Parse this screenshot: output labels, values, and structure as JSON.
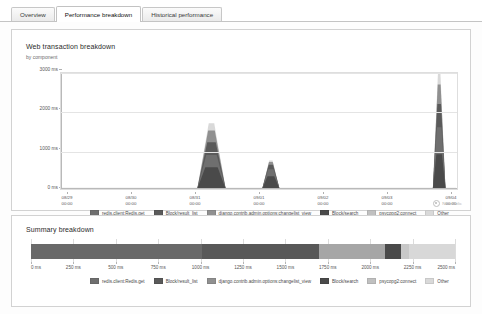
{
  "tabs": [
    {
      "label": "Overview",
      "active": false
    },
    {
      "label": "Performance breakdown",
      "active": true
    },
    {
      "label": "Historical performance",
      "active": false
    }
  ],
  "breakdown_panel": {
    "title": "Web transaction breakdown",
    "subtitle": "by component",
    "watermark": "New Relic"
  },
  "summary_panel": {
    "title": "Summary breakdown"
  },
  "legend": [
    {
      "label": "redis.client:Redis.get",
      "color": "#6f6f6f"
    },
    {
      "label": "Block/result_list",
      "color": "#5a5a5a"
    },
    {
      "label": "django.contrib.admin.options:changelist_view",
      "color": "#909090"
    },
    {
      "label": "Block/search",
      "color": "#4a4a4a"
    },
    {
      "label": "psycopg2:connect",
      "color": "#c0c0c0"
    },
    {
      "label": "Other",
      "color": "#d9d9d9"
    }
  ],
  "chart_data": [
    {
      "type": "area",
      "title": "Web transaction breakdown",
      "subtitle": "by component",
      "xlabel": "",
      "ylabel": "",
      "ylim": [
        0,
        3000
      ],
      "yticks": [
        0,
        1000,
        2000,
        3000
      ],
      "ytick_labels": [
        "0 ms",
        "1000 ms",
        "2000 ms",
        "3000 ms"
      ],
      "grid": true,
      "legend_position": "bottom",
      "x_tick_labels": [
        {
          "date": "08/29",
          "time": "00:00"
        },
        {
          "date": "08/30",
          "time": "00:00"
        },
        {
          "date": "08/31",
          "time": "00:00"
        },
        {
          "date": "09/01",
          "time": "00:00"
        },
        {
          "date": "09/02",
          "time": "00:00"
        },
        {
          "date": "09/03",
          "time": "00:00"
        },
        {
          "date": "09/04",
          "time": "00:00"
        }
      ],
      "series": [
        {
          "name": "redis.client:Redis.get",
          "color": "#6f6f6f"
        },
        {
          "name": "Block/result_list",
          "color": "#5a5a5a"
        },
        {
          "name": "django.contrib.admin.options:changelist_view",
          "color": "#909090"
        },
        {
          "name": "Block/search",
          "color": "#4a4a4a"
        },
        {
          "name": "psycopg2:connect",
          "color": "#c0c0c0"
        },
        {
          "name": "Other",
          "color": "#d9d9d9"
        }
      ],
      "peaks": [
        {
          "center_pct": 38.0,
          "half_width_pct": 3.6,
          "height_ms": 1700,
          "stack": [
            {
              "series": "Block/search",
              "ms": 560,
              "color": "#4a4a4a"
            },
            {
              "series": "redis.client:Redis.get",
              "ms": 320,
              "color": "#6f6f6f"
            },
            {
              "series": "Block/result_list",
              "ms": 330,
              "color": "#5a5a5a"
            },
            {
              "series": "django.contrib.admin.options:changelist_view",
              "ms": 300,
              "color": "#909090"
            },
            {
              "series": "Other",
              "ms": 190,
              "color": "#d9d9d9"
            }
          ]
        },
        {
          "center_pct": 53.0,
          "half_width_pct": 2.2,
          "height_ms": 740,
          "stack": [
            {
              "series": "Block/search",
              "ms": 330,
              "color": "#4a4a4a"
            },
            {
              "series": "redis.client:Redis.get",
              "ms": 180,
              "color": "#6f6f6f"
            },
            {
              "series": "Block/result_list",
              "ms": 120,
              "color": "#5a5a5a"
            },
            {
              "series": "django.contrib.admin.options:changelist_view",
              "ms": 70,
              "color": "#909090"
            },
            {
              "series": "Other",
              "ms": 40,
              "color": "#d9d9d9"
            }
          ]
        },
        {
          "center_pct": 95.5,
          "half_width_pct": 1.6,
          "height_ms": 3000,
          "stack": [
            {
              "series": "Block/search",
              "ms": 900,
              "color": "#4a4a4a"
            },
            {
              "series": "redis.client:Redis.get",
              "ms": 700,
              "color": "#6f6f6f"
            },
            {
              "series": "Block/result_list",
              "ms": 600,
              "color": "#5a5a5a"
            },
            {
              "series": "django.contrib.admin.options:changelist_view",
              "ms": 500,
              "color": "#909090"
            },
            {
              "series": "Other",
              "ms": 300,
              "color": "#d9d9d9"
            }
          ]
        }
      ],
      "baseline_ms": 30
    },
    {
      "type": "bar",
      "orientation": "horizontal-stacked",
      "title": "Summary breakdown",
      "xlim": [
        0,
        2500
      ],
      "xticks": [
        0,
        250,
        500,
        750,
        1000,
        1250,
        1500,
        1750,
        2000,
        2250,
        2500
      ],
      "xtick_labels": [
        "0 ms",
        "250 ms",
        "500 ms",
        "750 ms",
        "1000 ms",
        "1250 ms",
        "1500 ms",
        "1750 ms",
        "2000 ms",
        "2250 ms",
        "2500 ms"
      ],
      "grid": true,
      "legend_position": "bottom",
      "categories": [
        "Summary"
      ],
      "segments": [
        {
          "name": "redis.client:Redis.get",
          "value": 1010,
          "color": "#696969"
        },
        {
          "name": "Block/result_list",
          "value": 690,
          "color": "#585858"
        },
        {
          "name": "django.contrib.admin.options:changelist_view",
          "value": 385,
          "color": "#a6a6a6"
        },
        {
          "name": "Block/search",
          "value": 95,
          "color": "#4a4a4a"
        },
        {
          "name": "psycopg2:connect",
          "value": 50,
          "color": "#c8c8c8"
        },
        {
          "name": "Other",
          "value": 270,
          "color": "#d8d8d8"
        }
      ],
      "total_ms": 2500
    }
  ]
}
